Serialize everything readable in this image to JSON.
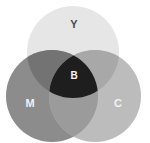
{
  "figure": {
    "background_color": "#ffffff",
    "width": 150,
    "height": 143
  },
  "chart_data": {
    "type": "venn",
    "title": "",
    "sets": [
      {
        "id": "Y",
        "label": "Y",
        "name": "Yellow",
        "color": "#e6e6e6",
        "label_color": "#4a4a4a",
        "cx": 73,
        "cy": 52,
        "r": 46
      },
      {
        "id": "M",
        "label": "M",
        "name": "Magenta",
        "color": "#8c8c8c",
        "label_color": "#f2f2f2",
        "cx": 52,
        "cy": 96,
        "r": 46
      },
      {
        "id": "C",
        "label": "C",
        "name": "Cyan",
        "color": "#bcbcbc",
        "label_color": "#f2f2f2",
        "cx": 95,
        "cy": 96,
        "r": 46
      }
    ],
    "intersections": [
      {
        "id": "MY",
        "sets": [
          "M",
          "Y"
        ],
        "label": "",
        "color": "#737373"
      },
      {
        "id": "CY",
        "sets": [
          "C",
          "Y"
        ],
        "label": "",
        "color": "#a8a8a8"
      },
      {
        "id": "MC",
        "sets": [
          "M",
          "C"
        ],
        "label": "",
        "color": "#9b9b9b"
      },
      {
        "id": "MYC",
        "sets": [
          "M",
          "Y",
          "C"
        ],
        "label": "B",
        "color": "#1e1e1e",
        "label_color": "#f5f5f5"
      }
    ],
    "labels": [
      {
        "id": "label-y",
        "text": "Y",
        "x": 74,
        "y": 25
      },
      {
        "id": "label-m",
        "text": "M",
        "x": 30,
        "y": 104
      },
      {
        "id": "label-c",
        "text": "C",
        "x": 118,
        "y": 104
      },
      {
        "id": "label-b",
        "text": "B",
        "x": 74,
        "y": 76
      }
    ]
  }
}
